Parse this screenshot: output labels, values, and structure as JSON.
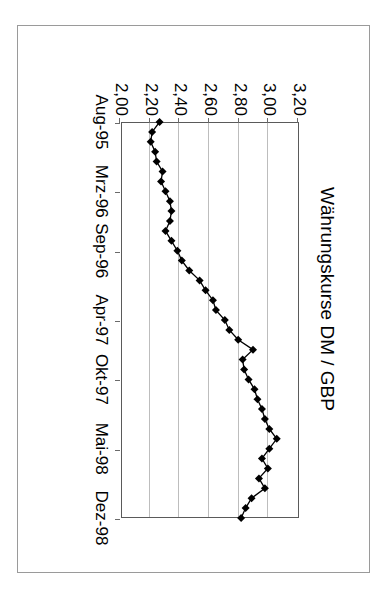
{
  "figure": {
    "title": "Währungskurse DM / GBP",
    "rotation_note": "printed-rotated-90deg",
    "colors": {
      "series": "#000000",
      "grid": "#bdbdbd",
      "axis": "#5a5a5a",
      "frame": "#9a9a9a",
      "background": "#ffffff"
    }
  },
  "chart_data": {
    "type": "line",
    "title": "Währungskurse DM / GBP",
    "xlabel": "",
    "ylabel": "",
    "grid": true,
    "legend": null,
    "marker": "diamond",
    "ylim": [
      2.0,
      3.2
    ],
    "yticks": [
      2.0,
      2.2,
      2.4,
      2.6,
      2.8,
      3.0,
      3.2
    ],
    "ytick_labels": [
      "2,00",
      "2,20",
      "2,40",
      "2,60",
      "2,80",
      "3,00",
      "3,20"
    ],
    "xtick_labels": [
      "Aug-95",
      "Mrz-96",
      "Sep-96",
      "Apr-97",
      "Okt-97",
      "Mai-98",
      "Dez-98"
    ],
    "xtick_index": [
      0,
      7,
      13,
      20,
      26,
      33,
      40
    ],
    "x": [
      "Aug-95",
      "Sep-95",
      "Okt-95",
      "Nov-95",
      "Dez-95",
      "Jan-96",
      "Feb-96",
      "Mrz-96",
      "Apr-96",
      "Mai-96",
      "Jun-96",
      "Jul-96",
      "Aug-96",
      "Sep-96",
      "Okt-96",
      "Nov-96",
      "Dez-96",
      "Jan-97",
      "Feb-97",
      "Mrz-97",
      "Apr-97",
      "Mai-97",
      "Jun-97",
      "Jul-97",
      "Aug-97",
      "Sep-97",
      "Okt-97",
      "Nov-97",
      "Dez-97",
      "Jan-98",
      "Feb-98",
      "Mrz-98",
      "Apr-98",
      "Mai-98",
      "Jun-98",
      "Jul-98",
      "Aug-98",
      "Sep-98",
      "Okt-98",
      "Nov-98",
      "Dez-98"
    ],
    "values": [
      2.26,
      2.21,
      2.2,
      2.23,
      2.24,
      2.28,
      2.27,
      2.3,
      2.33,
      2.34,
      2.33,
      2.3,
      2.34,
      2.38,
      2.41,
      2.46,
      2.53,
      2.57,
      2.62,
      2.64,
      2.7,
      2.73,
      2.79,
      2.89,
      2.82,
      2.83,
      2.86,
      2.9,
      2.92,
      2.95,
      2.97,
      3.0,
      3.05,
      3.0,
      2.95,
      2.99,
      2.93,
      2.97,
      2.88,
      2.84,
      2.81
    ],
    "series_name": "DM / GBP"
  }
}
